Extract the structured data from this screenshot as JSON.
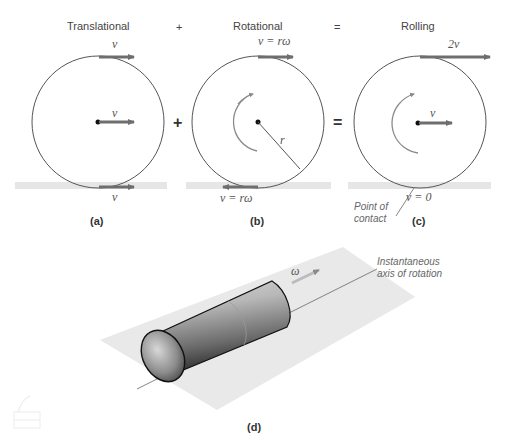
{
  "headers": {
    "translational": "Translational",
    "plus_top": "+",
    "rotational": "Rotational",
    "equals_top": "=",
    "rolling": "Rolling"
  },
  "operators": {
    "plus": "+",
    "equals": "="
  },
  "panel_a": {
    "label": "(a)",
    "top_velocity": "v",
    "center_velocity": "v",
    "bottom_velocity": "v"
  },
  "panel_b": {
    "label": "(b)",
    "top_velocity": "v = rω",
    "radius": "r",
    "bottom_velocity": "v = rω"
  },
  "panel_c": {
    "label": "(c)",
    "top_velocity": "2v",
    "center_velocity": "v",
    "contact_velocity": "v = 0",
    "contact_note_line1": "Point of",
    "contact_note_line2": "contact"
  },
  "panel_d": {
    "label": "(d)",
    "omega": "ω",
    "axis_note_line1": "Instantaneous",
    "axis_note_line2": "axis of rotation"
  },
  "colors": {
    "arrow": "#6e6e6e",
    "circle_stroke": "#555555",
    "ground": "#e6e6e6",
    "plane": "#e9e9e9"
  }
}
